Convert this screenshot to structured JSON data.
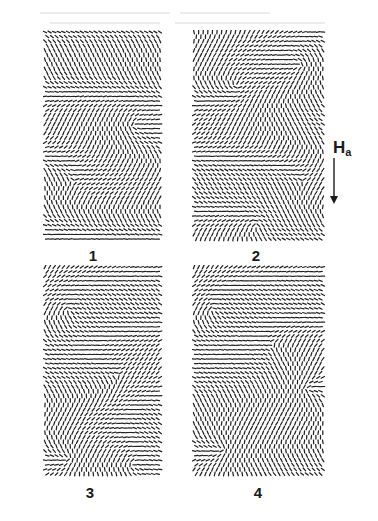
{
  "figure": {
    "background": "#ffffff",
    "ink_color": "#222222",
    "panels": [
      {
        "id": "1",
        "label": "1",
        "x": 43,
        "y": 30,
        "w": 120,
        "h": 216,
        "label_x": 93,
        "label_y": 248,
        "defects": [
          {
            "cx": 90,
            "cy": 95,
            "k": 1
          },
          {
            "cx": 30,
            "cy": 150,
            "k": -1
          }
        ],
        "stripes": 0.35,
        "seed": 11
      },
      {
        "id": "2",
        "label": "2",
        "x": 192,
        "y": 30,
        "w": 134,
        "h": 216,
        "label_x": 256,
        "label_y": 248,
        "defects": [
          {
            "cx": 45,
            "cy": 55,
            "k": 1
          },
          {
            "cx": 108,
            "cy": 35,
            "k": 1
          },
          {
            "cx": 65,
            "cy": 195,
            "k": 1
          },
          {
            "cx": 110,
            "cy": 150,
            "k": -1
          }
        ],
        "stripes": 0.3,
        "seed": 23
      },
      {
        "id": "3",
        "label": "3",
        "x": 43,
        "y": 265,
        "w": 120,
        "h": 216,
        "label_x": 90,
        "label_y": 485,
        "defects": [
          {
            "cx": 25,
            "cy": 45,
            "k": 1
          },
          {
            "cx": 90,
            "cy": 200,
            "k": 1
          },
          {
            "cx": 25,
            "cy": 195,
            "k": 1
          },
          {
            "cx": 75,
            "cy": 110,
            "k": -1
          }
        ],
        "stripes": 0.25,
        "seed": 37
      },
      {
        "id": "4",
        "label": "4",
        "x": 192,
        "y": 265,
        "w": 134,
        "h": 216,
        "label_x": 258,
        "label_y": 485,
        "defects": [
          {
            "cx": 20,
            "cy": 45,
            "k": 1
          },
          {
            "cx": 115,
            "cy": 125,
            "k": 1
          },
          {
            "cx": 30,
            "cy": 185,
            "k": 1
          },
          {
            "cx": 80,
            "cy": 80,
            "k": -1
          }
        ],
        "stripes": 0.25,
        "seed": 51
      }
    ],
    "field_indicator": {
      "label": "H",
      "subscript": "a",
      "label_x": 333,
      "label_y": 139,
      "arrow_x": 334,
      "arrow_y1": 158,
      "arrow_y2": 204,
      "direction": "down"
    },
    "dash": {
      "spacing": 4.6,
      "length": 3.6,
      "width": 1.25
    }
  }
}
